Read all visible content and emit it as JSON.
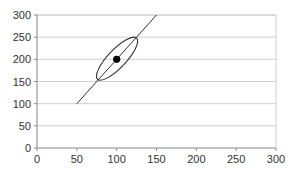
{
  "chart_data": {
    "type": "line",
    "title": "",
    "xlabel": "",
    "ylabel": "",
    "xlim": [
      0,
      300
    ],
    "ylim": [
      0,
      300
    ],
    "grid": "horizontal",
    "x_ticks": [
      "0",
      "50",
      "100",
      "150",
      "200",
      "250",
      "300"
    ],
    "y_ticks": [
      "0",
      "50",
      "100",
      "150",
      "200",
      "250",
      "300"
    ],
    "series": [
      {
        "name": "line",
        "type": "line",
        "x": [
          50,
          150
        ],
        "y": [
          100,
          300
        ]
      },
      {
        "name": "point",
        "type": "scatter",
        "x": [
          100
        ],
        "y": [
          200
        ]
      }
    ],
    "annotations": [
      {
        "type": "ellipse",
        "center": [
          100,
          200
        ],
        "endpoints": [
          [
            76,
            155
          ],
          [
            125,
            248
          ]
        ],
        "description": "confidence ellipse around point along line"
      }
    ]
  },
  "colors": {
    "line": "#333333",
    "grid": "#cfcfcf",
    "axis": "#888888",
    "point": "#000000"
  }
}
